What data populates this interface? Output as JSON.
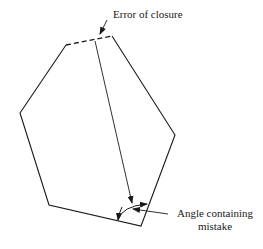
{
  "diagram": {
    "type": "traverse-polygon",
    "labels": {
      "error_of_closure": "Error of closure",
      "angle_line1": "Angle containing",
      "angle_line2": "mistake"
    },
    "vertices": [
      {
        "id": "top-left",
        "x": 66,
        "y": 45
      },
      {
        "id": "left",
        "x": 20,
        "y": 113
      },
      {
        "id": "bottom-left",
        "x": 49,
        "y": 205
      },
      {
        "id": "bottom-right",
        "x": 141,
        "y": 226
      },
      {
        "id": "right",
        "x": 175,
        "y": 135
      },
      {
        "id": "top-right",
        "x": 112,
        "y": 36
      }
    ],
    "closure_gap": {
      "from": "top-left",
      "to": "top-right",
      "style": "dashed"
    },
    "line_color": "#1a1a1a"
  }
}
